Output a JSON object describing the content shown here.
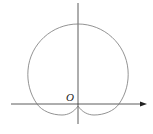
{
  "diagram": {
    "type": "polar-curve",
    "origin_label": "O",
    "colors": {
      "axis": "#333333",
      "curve": "#777777",
      "background": "#ffffff"
    }
  }
}
